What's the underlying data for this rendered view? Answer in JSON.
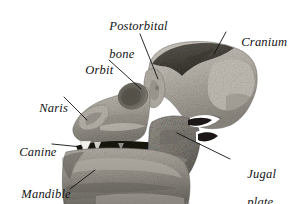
{
  "figure": {
    "kind": "annotated-photograph",
    "background_color": "#ffffff",
    "leader_line_color": "#111111",
    "alt": "Grayscale photograph of a fossil skull in left lateral view with seven anatomical structures labelled by leader lines."
  },
  "labels": [
    {
      "id": "postorbital-bone",
      "text_line1": "Postorbital",
      "text_line2": "bone",
      "x": 96,
      "y": 6,
      "lines": 2
    },
    {
      "id": "cranium",
      "text_line1": "Cranium",
      "text_line2": "",
      "x": 228,
      "y": 24,
      "lines": 1
    },
    {
      "id": "orbit",
      "text_line1": "Orbit",
      "text_line2": "",
      "x": 72,
      "y": 52,
      "lines": 1
    },
    {
      "id": "naris",
      "text_line1": "Naris",
      "text_line2": "",
      "x": 26,
      "y": 90,
      "lines": 1
    },
    {
      "id": "canine",
      "text_line1": "Canine",
      "text_line2": "",
      "x": 6,
      "y": 134,
      "lines": 1
    },
    {
      "id": "mandible",
      "text_line1": "Mandible",
      "text_line2": "",
      "x": 8,
      "y": 176,
      "lines": 1
    },
    {
      "id": "jugal-plate",
      "text_line1": "Jugal",
      "text_line2": "plate",
      "x": 234,
      "y": 154,
      "lines": 2
    }
  ],
  "leader_lines": [
    {
      "id": "postorbital-bone-leader",
      "x1": 140,
      "y1": 34,
      "x2": 158,
      "y2": 79
    },
    {
      "id": "cranium-leader",
      "x1": 226,
      "y1": 32,
      "x2": 214,
      "y2": 54
    },
    {
      "id": "orbit-leader",
      "x1": 109,
      "y1": 60,
      "x2": 141,
      "y2": 89
    },
    {
      "id": "naris-leader",
      "x1": 64,
      "y1": 97,
      "x2": 87,
      "y2": 120
    },
    {
      "id": "canine-leader",
      "x1": 52,
      "y1": 144,
      "x2": 82,
      "y2": 147
    },
    {
      "id": "mandible-leader",
      "x1": 70,
      "y1": 189,
      "x2": 95,
      "y2": 170
    },
    {
      "id": "jugal-plate-leader",
      "x1": 230,
      "y1": 159,
      "x2": 177,
      "y2": 133
    }
  ],
  "specimen_regions": [
    {
      "id": "cranium-region",
      "name": "cranium"
    },
    {
      "id": "postorbital-bone-region",
      "name": "postorbital bone"
    },
    {
      "id": "orbit-region",
      "name": "orbit"
    },
    {
      "id": "naris-region",
      "name": "naris"
    },
    {
      "id": "canine-region",
      "name": "canine tooth"
    },
    {
      "id": "jugal-plate-region",
      "name": "jugal plate"
    },
    {
      "id": "mandible-region",
      "name": "mandible"
    }
  ]
}
